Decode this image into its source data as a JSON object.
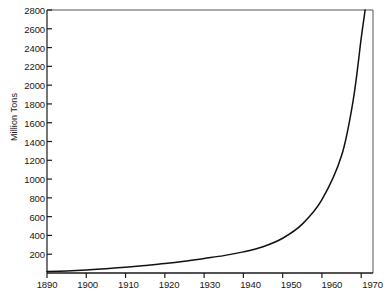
{
  "chart_data": {
    "type": "line",
    "title": "",
    "xlabel": "",
    "ylabel": "Million Tons",
    "xlim": [
      1890,
      1973
    ],
    "ylim": [
      0,
      2800
    ],
    "grid": false,
    "legend": false,
    "x_ticks": [
      1890,
      1900,
      1910,
      1920,
      1930,
      1940,
      1950,
      1960,
      1970
    ],
    "y_ticks": [
      200,
      400,
      600,
      800,
      1000,
      1200,
      1400,
      1600,
      1800,
      2000,
      2200,
      2400,
      2600,
      2800
    ],
    "series": [
      {
        "name": "Production",
        "color": "#111111",
        "x": [
          1890,
          1895,
          1900,
          1905,
          1910,
          1915,
          1920,
          1925,
          1930,
          1935,
          1940,
          1945,
          1950,
          1955,
          1960,
          1965,
          1968,
          1970,
          1971
        ],
        "values": [
          15,
          22,
          32,
          45,
          62,
          80,
          100,
          125,
          155,
          185,
          225,
          280,
          370,
          520,
          780,
          1250,
          1850,
          2500,
          2800
        ]
      }
    ]
  },
  "axis": {
    "y_title": "Million Tons",
    "y_tick_labels": [
      "2800",
      "2600",
      "2400",
      "2200",
      "2000",
      "1800",
      "1600",
      "1400",
      "1200",
      "1000",
      "800",
      "600",
      "400",
      "200"
    ],
    "x_tick_labels": [
      "1890",
      "1900",
      "1910",
      "1920",
      "1930",
      "1940",
      "1950",
      "1960",
      "1970"
    ]
  },
  "style": {
    "background": "#ffffff",
    "axis_color": "#1a1a1a",
    "curve_color": "#111111"
  }
}
